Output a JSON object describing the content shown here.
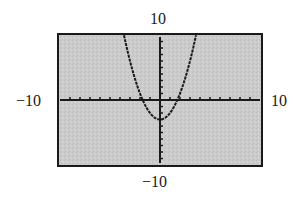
{
  "chart_data": {
    "type": "line",
    "title": "",
    "function": "y = x^2 - 3",
    "window": {
      "xmin": -10,
      "xmax": 10,
      "xscl": 1,
      "ymin": -10,
      "ymax": 10,
      "yscl": 1
    },
    "xlim": [
      -10,
      10
    ],
    "ylim": [
      -10,
      10
    ],
    "xlabel": "",
    "ylabel": "",
    "tick_labels": {
      "ymax": "10",
      "xmin": "−10",
      "xmax": "10",
      "ymin": "−10"
    },
    "vertex": [
      0,
      -3
    ],
    "x_intercepts": [
      -1.73,
      1.73
    ],
    "series": [
      {
        "name": "y = x^2 - 3",
        "x": [
          -3.6,
          -3,
          -2.5,
          -2,
          -1.5,
          -1,
          -0.5,
          0,
          0.5,
          1,
          1.5,
          2,
          2.5,
          3,
          3.6
        ],
        "y": [
          9.96,
          6,
          3.25,
          1,
          -0.75,
          -2,
          -2.75,
          -3,
          -2.75,
          -2,
          -0.75,
          1,
          3.25,
          6,
          9.96
        ]
      }
    ],
    "grid": false,
    "legend": null,
    "colors": {
      "screen_background": "#c8c8c8",
      "frame": "#1a1a1a",
      "axes": "#1a1a1a",
      "curve": "#1a1a1a"
    }
  }
}
